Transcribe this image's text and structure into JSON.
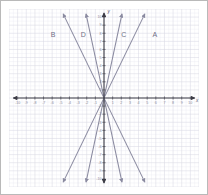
{
  "figure": {
    "frame_border_color": "#b9b9b9",
    "background": "#ffffff"
  },
  "chart_data": {
    "type": "line",
    "title": "",
    "xlabel": "x",
    "ylabel": "y",
    "xlim": [
      -11,
      11
    ],
    "ylim": [
      -11,
      11
    ],
    "grid": true,
    "grid_color": "#d9d9e4",
    "grid_minor_color": "#ebebf2",
    "axis_color": "#3c3c46",
    "line_color": "#8a8aa0",
    "label_color": "#6f6f86",
    "x_ticks": [
      -10,
      -9,
      -8,
      -7,
      -6,
      -5,
      -4,
      -3,
      -2,
      -1,
      1,
      2,
      3,
      4,
      5,
      6,
      7,
      8,
      9,
      10
    ],
    "y_ticks": [
      10,
      9,
      8,
      7,
      6,
      5,
      4,
      3,
      2,
      1,
      -1,
      -2,
      -3,
      -4,
      -5,
      -6,
      -7,
      -8,
      -9,
      -10
    ],
    "x_tick_labels": [
      "-10",
      "-9",
      "-8",
      "-7",
      "-6",
      "-5",
      "-4",
      "-3",
      "-2",
      "-1",
      "1",
      "2",
      "3",
      "4",
      "5",
      "6",
      "7",
      "8",
      "9",
      "10"
    ],
    "y_tick_labels": [
      "10",
      "9",
      "8",
      "7",
      "6",
      "5",
      "4",
      "3",
      "2",
      "1",
      "-1",
      "-2",
      "-3",
      "-4",
      "-5",
      "-6",
      "-7",
      "-8",
      "-9",
      "-10"
    ],
    "series": [
      {
        "name": "A",
        "label": "A",
        "slope": 2.2,
        "through": [
          0,
          0
        ],
        "label_pos": [
          5.9,
          7.6
        ],
        "arrows": "both"
      },
      {
        "name": "B",
        "label": "B",
        "slope": -2.2,
        "through": [
          0,
          0
        ],
        "label_pos": [
          -5.9,
          7.6
        ],
        "arrows": "both"
      },
      {
        "name": "C",
        "label": "C",
        "slope": 5.0,
        "through": [
          0,
          0
        ],
        "label_pos": [
          2.3,
          7.6
        ],
        "arrows": "both"
      },
      {
        "name": "D",
        "label": "D",
        "slope": -5.0,
        "through": [
          0,
          0
        ],
        "label_pos": [
          -2.4,
          7.6
        ],
        "arrows": "both"
      }
    ],
    "legend": null,
    "legend_position": "none",
    "annotations": [
      {
        "text": "A",
        "x": 5.9,
        "y": 7.6
      },
      {
        "text": "B",
        "x": -5.9,
        "y": 7.6
      },
      {
        "text": "C",
        "x": 2.3,
        "y": 7.6
      },
      {
        "text": "D",
        "x": -2.4,
        "y": 7.6
      }
    ]
  }
}
